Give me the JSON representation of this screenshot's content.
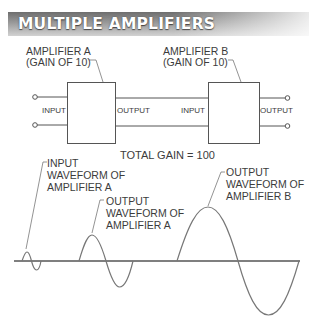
{
  "title": "MULTIPLE AMPLIFIERS",
  "amplifiers": [
    {
      "id": "A",
      "name": "AMPLIFIER A",
      "gain_label": "(GAIN OF 10)",
      "input_label": "INPUT",
      "output_label": "OUTPUT"
    },
    {
      "id": "B",
      "name": "AMPLIFIER B",
      "gain_label": "(GAIN OF 10)",
      "input_label": "INPUT",
      "output_label": "OUTPUT"
    }
  ],
  "total_gain_label": "TOTAL GAIN = 100",
  "waveform_labels": {
    "input_a": [
      "INPUT",
      "WAVEFORM OF",
      "AMPLIFIER A"
    ],
    "output_a": [
      "OUTPUT",
      "WAVEFORM OF",
      "AMPLIFIER A"
    ],
    "output_b": [
      "OUTPUT",
      "WAVEFORM OF",
      "AMPLIFIER B"
    ]
  },
  "waveforms": [
    {
      "name": "input-waveform-amplifier-a",
      "start_x": 22,
      "end_x": 41,
      "amplitude": 9
    },
    {
      "name": "output-waveform-amplifier-a",
      "start_x": 79,
      "end_x": 133,
      "amplitude": 26
    },
    {
      "name": "output-waveform-amplifier-b",
      "start_x": 177,
      "end_x": 299,
      "amplitude": 54
    }
  ],
  "colors": {
    "line": "#555555",
    "wave": "#777777",
    "banner_dark": "#6e6e6e",
    "banner_light": "#d2d2d2",
    "text": "#3c3c3c"
  }
}
